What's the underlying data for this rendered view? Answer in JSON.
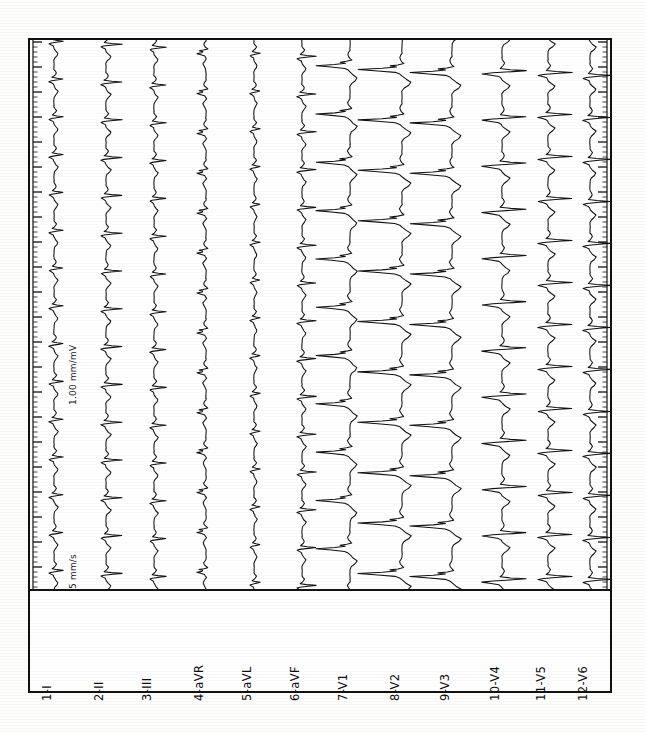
{
  "document": {
    "type": "12-lead-electrocardiogram",
    "orientation": "rotated-90-landscape-scan",
    "background_color": "#fdfdfc",
    "trace_color": "#111111",
    "frame_color": "#111111"
  },
  "annotations": {
    "gain": "1.00 mm/mV",
    "speed": "25 mm/s"
  },
  "scale_rulers": {
    "left": {
      "present": true,
      "minor_tick_spacing_px": 5,
      "major_tick_every": 5
    },
    "right": {
      "present": true,
      "minor_tick_spacing_px": 5,
      "major_tick_every": 5
    }
  },
  "chart_data": {
    "type": "line",
    "title": "",
    "xlabel": "",
    "ylabel": "",
    "grid": false,
    "legend_position": "bottom",
    "axis_note": "Traces run vertically; time advances downward, amplitude deflects horizontally",
    "beats_visible": 13,
    "beat_interval_px": 42,
    "categories": [
      "1-I",
      "2-II",
      "3-III",
      "4-aVR",
      "5-aVL",
      "6-aVF",
      "7-V1",
      "8-V2",
      "9-V3",
      "10-V4",
      "11-V5",
      "12-V6"
    ],
    "series": [
      {
        "name": "1-I",
        "baseline_x": 52,
        "amplitude": 9,
        "polarity": 1,
        "s_depth": 5,
        "t_amp": 4,
        "width": 0.9
      },
      {
        "name": "2-II",
        "baseline_x": 104,
        "amplitude": 16,
        "polarity": 1,
        "s_depth": 5,
        "t_amp": 5,
        "width": 0.9
      },
      {
        "name": "3-III",
        "baseline_x": 152,
        "amplitude": 12,
        "polarity": 1,
        "s_depth": 4,
        "t_amp": 4,
        "width": 0.9
      },
      {
        "name": "4-aVR",
        "baseline_x": 204,
        "amplitude": 7,
        "polarity": -1,
        "s_depth": 9,
        "t_amp": -3,
        "width": 0.95
      },
      {
        "name": "5-aVL",
        "baseline_x": 252,
        "amplitude": 6,
        "polarity": 1,
        "s_depth": 4,
        "t_amp": 3,
        "width": 0.9
      },
      {
        "name": "6-aVF",
        "baseline_x": 300,
        "amplitude": 14,
        "polarity": 1,
        "s_depth": 5,
        "t_amp": 4,
        "width": 0.9
      },
      {
        "name": "7-V1",
        "baseline_x": 348,
        "amplitude": 10,
        "polarity": -1,
        "s_depth": 34,
        "t_amp": 7,
        "width": 1.15
      },
      {
        "name": "8-V2",
        "baseline_x": 400,
        "amplitude": 12,
        "polarity": -1,
        "s_depth": 44,
        "t_amp": 9,
        "width": 1.2
      },
      {
        "name": "9-V3",
        "baseline_x": 450,
        "amplitude": 14,
        "polarity": -1,
        "s_depth": 42,
        "t_amp": 9,
        "width": 1.2
      },
      {
        "name": "10-V4",
        "baseline_x": 500,
        "amplitude": 24,
        "polarity": 1,
        "s_depth": 20,
        "t_amp": 8,
        "width": 1.1
      },
      {
        "name": "11-V5",
        "baseline_x": 546,
        "amplitude": 24,
        "polarity": 1,
        "s_depth": 10,
        "t_amp": 7,
        "width": 1.0
      },
      {
        "name": "12-V6",
        "baseline_x": 588,
        "amplitude": 20,
        "polarity": 1,
        "s_depth": 7,
        "t_amp": 6,
        "width": 1.0
      }
    ]
  },
  "labels": {
    "leads": [
      {
        "text": "1-I",
        "x": 52
      },
      {
        "text": "2-II",
        "x": 104
      },
      {
        "text": "3-III",
        "x": 152
      },
      {
        "text": "4-aVR",
        "x": 204
      },
      {
        "text": "5-aVL",
        "x": 252
      },
      {
        "text": "6-aVF",
        "x": 300
      },
      {
        "text": "7-V1",
        "x": 348
      },
      {
        "text": "8-V2",
        "x": 400
      },
      {
        "text": "9-V3",
        "x": 450
      },
      {
        "text": "10-V4",
        "x": 500
      },
      {
        "text": "11-V5",
        "x": 546
      },
      {
        "text": "12-V6",
        "x": 588
      }
    ]
  }
}
